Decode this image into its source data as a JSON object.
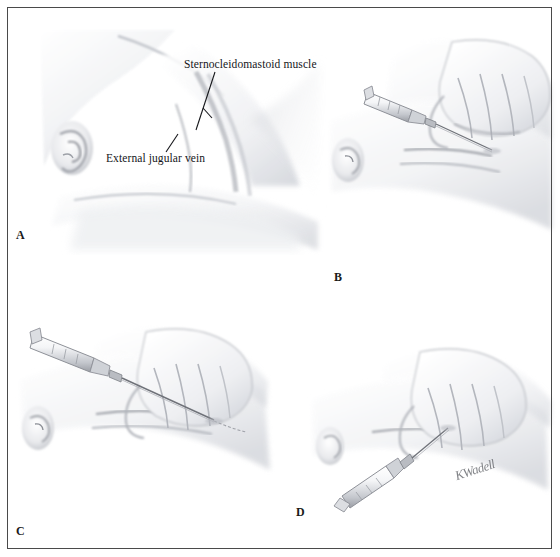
{
  "figure": {
    "medium": "graphite pencil illustration",
    "background_color": "#ffffff",
    "frame_color": "#4a4a4a",
    "ink_color": "#15161a",
    "shade_color": "#b9bcc2",
    "signature": "KWadell"
  },
  "labels": {
    "sternocleidomastoid": "Sternocleidomastoid muscle",
    "external_jugular_vein": "External jugular vein"
  },
  "panels": [
    {
      "id": "a",
      "letter": "A",
      "caption": "Neck anatomy with head turned, showing surface landmarks"
    },
    {
      "id": "b",
      "letter": "B",
      "caption": "Vein tamponaded above clavicle; needle and syringe advanced along vein"
    },
    {
      "id": "c",
      "letter": "C",
      "caption": "Guidewire or catheter threaded through the needle into the vein"
    },
    {
      "id": "d",
      "letter": "D",
      "caption": "Syringe angled downward while catheter is secured in place"
    }
  ]
}
